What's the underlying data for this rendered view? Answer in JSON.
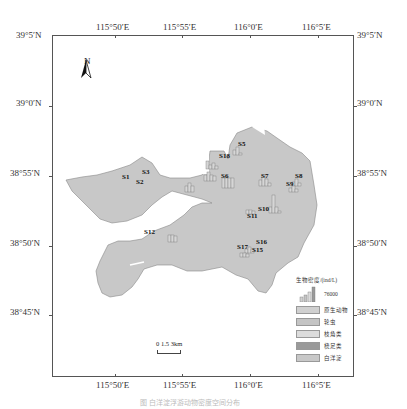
{
  "map": {
    "x_ticks": [
      "115°50′E",
      "115°55′E",
      "116°0′E",
      "116°5′E"
    ],
    "y_ticks": [
      "39°5′N",
      "39°0′N",
      "38°55′N",
      "38°50′N",
      "38°45′N"
    ],
    "north_label": "N",
    "scale_label": "0  1.5  3km",
    "colors": {
      "land": "#c8c8c8",
      "frame": "#555555",
      "background": "#ffffff"
    },
    "stations": [
      {
        "id": "S1",
        "label": "S1"
      },
      {
        "id": "S2",
        "label": "S2"
      },
      {
        "id": "S3",
        "label": "S3"
      },
      {
        "id": "S5",
        "label": "S5"
      },
      {
        "id": "S6",
        "label": "S6"
      },
      {
        "id": "S7",
        "label": "S7"
      },
      {
        "id": "S8",
        "label": "S8"
      },
      {
        "id": "S9",
        "label": "S9"
      },
      {
        "id": "S10",
        "label": "S10"
      },
      {
        "id": "S11",
        "label": "S11"
      },
      {
        "id": "S12",
        "label": "S12"
      },
      {
        "id": "S15",
        "label": "S15"
      },
      {
        "id": "S16",
        "label": "S16"
      },
      {
        "id": "S17",
        "label": "S17"
      },
      {
        "id": "S18",
        "label": "S18"
      }
    ]
  },
  "legend": {
    "title": "生物密度/(ind/L)",
    "scale_value": "76000",
    "items": [
      {
        "label": "原生动物",
        "color": "#d0d0d0"
      },
      {
        "label": "轮虫",
        "color": "#c4c4c4"
      },
      {
        "label": "枝角类",
        "color": "#dcdcdc"
      },
      {
        "label": "桡足类",
        "color": "#9a9a9a"
      },
      {
        "label": "白洋淀",
        "color": "#c8c8c8"
      }
    ]
  },
  "caption": "图 白洋淀浮游动物密度空间分布"
}
